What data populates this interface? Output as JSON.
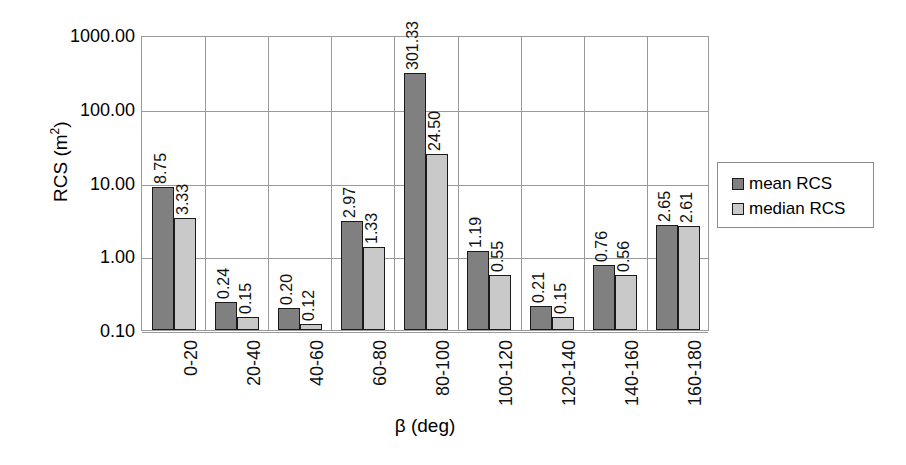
{
  "chart_data": {
    "type": "bar",
    "title": "",
    "xlabel": "β (deg)",
    "ylabel": "RCS (m2)",
    "ylabel_base": "RCS (m",
    "ylabel_sup": "2",
    "ylabel_tail": ")",
    "yscale": "log",
    "ylim": [
      0.1,
      1000.0
    ],
    "grid": true,
    "legend_position": "right",
    "categories": [
      "0-20",
      "20-40",
      "40-60",
      "60-80",
      "80-100",
      "100-120",
      "120-140",
      "140-160",
      "160-180"
    ],
    "y_ticks": [
      {
        "value": 1000.0,
        "label": "1000.00"
      },
      {
        "value": 100.0,
        "label": "100.00"
      },
      {
        "value": 10.0,
        "label": "10.00"
      },
      {
        "value": 1.0,
        "label": "1.00"
      },
      {
        "value": 0.1,
        "label": "0.10"
      }
    ],
    "series": [
      {
        "name": "mean RCS",
        "color": "#808080",
        "values": [
          8.75,
          0.24,
          0.2,
          2.97,
          301.33,
          1.19,
          0.21,
          0.76,
          2.65
        ],
        "labels": [
          "8.75",
          "0.24",
          "0.20",
          "2.97",
          "301.33",
          "1.19",
          "0.21",
          "0.76",
          "2.65"
        ]
      },
      {
        "name": "median RCS",
        "color": "#c9c9c9",
        "values": [
          3.33,
          0.15,
          0.12,
          1.33,
          24.5,
          0.55,
          0.15,
          0.56,
          2.61
        ],
        "labels": [
          "3.33",
          "0.15",
          "0.12",
          "1.33",
          "24.50",
          "0.55",
          "0.15",
          "0.56",
          "2.61"
        ]
      }
    ]
  },
  "legend": {
    "items": [
      {
        "label": "mean RCS",
        "swatch": "mean"
      },
      {
        "label": "median RCS",
        "swatch": "median"
      }
    ]
  }
}
